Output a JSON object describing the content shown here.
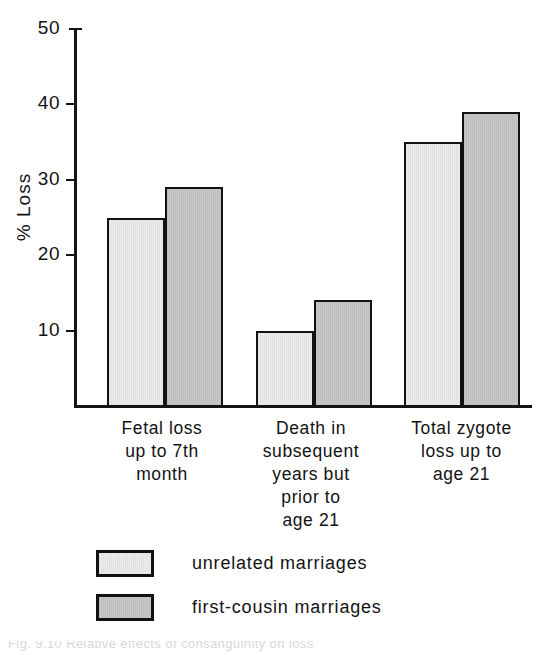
{
  "chart_data": {
    "type": "bar",
    "title": "",
    "xlabel": "",
    "ylabel": "% Loss",
    "ylim": [
      0,
      50
    ],
    "ytick_values": [
      50,
      40,
      30,
      20,
      10
    ],
    "ytick_labels": [
      "50",
      "40",
      "30",
      "20",
      "10"
    ],
    "grid": false,
    "legend_position": "bottom-left",
    "categories": [
      "Fetal loss\nup to 7th\nmonth",
      "Death in\nsubsequent\nyears but\nprior to\nage 21",
      "Total zygote\nloss up to\nage 21"
    ],
    "series": [
      {
        "name": "unrelated marriages",
        "color": "#ececec",
        "values": [
          25,
          10,
          35
        ]
      },
      {
        "name": "first-cousin marriages",
        "color": "#c7c7c7",
        "values": [
          29,
          14,
          39
        ]
      }
    ]
  },
  "axis": {
    "y_title": "% Loss",
    "ticks": [
      {
        "label": "50",
        "value": 50
      },
      {
        "label": "40",
        "value": 40
      },
      {
        "label": "30",
        "value": 30
      },
      {
        "label": "20",
        "value": 20
      },
      {
        "label": "10",
        "value": 10
      }
    ]
  },
  "categories": [
    {
      "label": "Fetal loss\nup to 7th\nmonth"
    },
    {
      "label": "Death in\nsubsequent\nyears but\nprior to\nage 21"
    },
    {
      "label": "Total zygote\nloss up to\nage 21"
    }
  ],
  "legend": {
    "entries": [
      {
        "label": "unrelated marriages",
        "swatch": "light"
      },
      {
        "label": "first-cousin marriages",
        "swatch": "dark"
      }
    ]
  },
  "caption": {
    "text": "Fig. 9.10 Relative effects of consanguinity on loss"
  }
}
